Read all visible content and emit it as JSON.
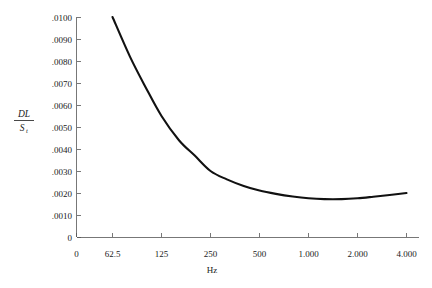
{
  "chart_data": {
    "type": "line",
    "title": "",
    "subtitle": "",
    "xlabel": "Hz",
    "ylabel": "DL / S_t",
    "ylabel_numerator": "DL",
    "ylabel_denominator": "S",
    "ylabel_denominator_subscript": "t",
    "x_scale": "log2-octave",
    "x_tick_labels": [
      "0",
      "62.5",
      "125",
      "250",
      "500",
      "1.000",
      "2.000",
      "4.000"
    ],
    "x_tick_values": [
      0,
      62.5,
      125,
      250,
      500,
      1000,
      2000,
      4000
    ],
    "y_tick_labels": [
      "0",
      ".0010",
      ".0020",
      ".0030",
      ".0040",
      ".0050",
      ".0060",
      ".0070",
      ".0080",
      ".0090",
      ".0100"
    ],
    "y_tick_values": [
      0,
      0.001,
      0.002,
      0.003,
      0.004,
      0.005,
      0.006,
      0.007,
      0.008,
      0.009,
      0.01
    ],
    "ylim": [
      0,
      0.01
    ],
    "grid": false,
    "legend": false,
    "legend_position": "none",
    "series": [
      {
        "name": "DL/St vs frequency",
        "color": "#111111",
        "x": [
          62.5,
          80,
          100,
          125,
          160,
          200,
          250,
          315,
          400,
          500,
          630,
          800,
          1000,
          1250,
          1600,
          2000,
          2500,
          3150,
          4000
        ],
        "y": [
          0.01,
          0.0082,
          0.0068,
          0.0055,
          0.0044,
          0.0037,
          0.003,
          0.00262,
          0.00232,
          0.00211,
          0.00196,
          0.00184,
          0.00176,
          0.00172,
          0.00172,
          0.00176,
          0.00183,
          0.00191,
          0.002
        ]
      }
    ],
    "annotations": []
  },
  "axis_style": {
    "axis_color": "#555555",
    "curve_color": "#111111",
    "text_color": "#1a1a1a",
    "background": "#ffffff"
  }
}
